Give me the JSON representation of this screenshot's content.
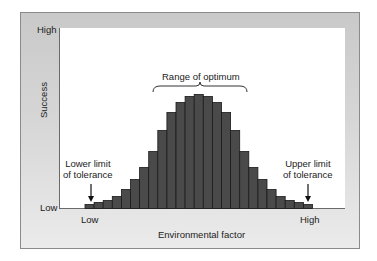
{
  "chart_data": {
    "type": "bar",
    "title": "",
    "xlabel": "Environmental factor",
    "ylabel": "Success",
    "x_tick_labels": [
      "Low",
      "High"
    ],
    "y_tick_labels": [
      "Low",
      "High"
    ],
    "grid": false,
    "legend": null,
    "bar_color": "#4a4a4a",
    "categories": [
      1,
      2,
      3,
      4,
      5,
      6,
      7,
      8,
      9,
      10,
      11,
      12,
      13,
      14,
      15,
      16,
      17,
      18,
      19,
      20,
      21,
      22,
      23,
      24,
      25
    ],
    "values": [
      4,
      6,
      8,
      12,
      19,
      29,
      41,
      57,
      78,
      96,
      106,
      112,
      114,
      112,
      106,
      96,
      78,
      57,
      41,
      29,
      19,
      12,
      8,
      6,
      4
    ],
    "ylim": [
      0,
      181
    ],
    "annotations": [
      {
        "text": "Range of optimum",
        "type": "brace",
        "span_bars": [
          11,
          15
        ]
      },
      {
        "text": "Lower limit of tolerance",
        "type": "arrow",
        "bar": 1
      },
      {
        "text": "Upper limit of tolerance",
        "type": "arrow",
        "bar": 25
      }
    ]
  },
  "labels": {
    "y_high": "High",
    "y_low": "Low",
    "y_title": "Success",
    "x_low": "Low",
    "x_high": "High",
    "x_title": "Environmental factor",
    "optimum": "Range of optimum",
    "lower_limit_1": "Lower limit",
    "lower_limit_2": "of tolerance",
    "upper_limit_1": "Upper limit",
    "upper_limit_2": "of tolerance"
  }
}
